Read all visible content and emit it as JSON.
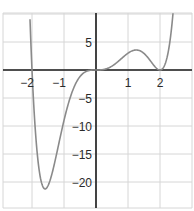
{
  "chart_data": {
    "type": "line",
    "title": "",
    "xlabel": "",
    "ylabel": "",
    "function": "y = x^3 (x - 2)^2 (x + 2)",
    "xlim": [
      -3,
      3
    ],
    "ylim": [
      -25,
      10
    ],
    "grid": true,
    "legend": null,
    "x_ticks": [
      {
        "value": -2,
        "label": "−2"
      },
      {
        "value": -1,
        "label": "−1"
      },
      {
        "value": 1,
        "label": "1"
      },
      {
        "value": 2,
        "label": "2"
      }
    ],
    "y_ticks": [
      {
        "value": 5,
        "label": "5"
      },
      {
        "value": -5,
        "label": "−5"
      },
      {
        "value": -10,
        "label": "−10"
      },
      {
        "value": -15,
        "label": "−15"
      },
      {
        "value": -20,
        "label": "−20"
      }
    ],
    "key_points": [
      {
        "name": "root",
        "x": -2,
        "y": 0
      },
      {
        "name": "local-min",
        "x": -1.56,
        "y": -21
      },
      {
        "name": "inflection-root",
        "x": 0,
        "y": 0
      },
      {
        "name": "local-max",
        "x": 1.25,
        "y": 3.6
      },
      {
        "name": "double-root",
        "x": 2,
        "y": 0
      }
    ],
    "series": [
      {
        "name": "f(x)",
        "color": "#8a8a8a"
      }
    ]
  },
  "colors": {
    "grid": "#d6d6d6",
    "axis": "#1a1a1a",
    "curve": "#8a8a8a"
  }
}
